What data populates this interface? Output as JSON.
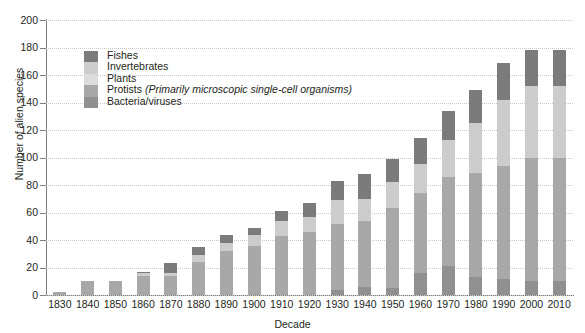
{
  "chart_data": {
    "type": "bar",
    "subtype": "stacked-bar",
    "title": "",
    "xlabel": "Decade",
    "ylabel": "Number of alien species",
    "ylim": [
      0,
      200
    ],
    "ytick_step": 20,
    "yticks": [
      0,
      20,
      40,
      60,
      80,
      100,
      120,
      140,
      160,
      180,
      200
    ],
    "grid": true,
    "grid_style": "dotted-horizontal",
    "legend_position": "inside-top-left",
    "categories": [
      "1830",
      "1840",
      "1850",
      "1860",
      "1870",
      "1880",
      "1890",
      "1900",
      "1910",
      "1920",
      "1930",
      "1940",
      "1950",
      "1960",
      "1970",
      "1980",
      "1990",
      "2000",
      "2010"
    ],
    "stack_order_bottom_to_top": [
      "Bacteria/viruses",
      "Protists",
      "Plants",
      "Invertebrates",
      "Fishes"
    ],
    "series": [
      {
        "name": "Fishes",
        "color": "#7b7b7b",
        "values": [
          0,
          0,
          0,
          1,
          7,
          6,
          6,
          5,
          7,
          10,
          14,
          18,
          17,
          19,
          21,
          24,
          27,
          26,
          26
        ]
      },
      {
        "name": "Invertebrates",
        "color": "#cccccc",
        "values": [
          0,
          0,
          0,
          2,
          2,
          5,
          6,
          8,
          11,
          11,
          17,
          16,
          19,
          21,
          27,
          36,
          48,
          52,
          52
        ]
      },
      {
        "name": "Plants",
        "color": "#dcdcdc",
        "values": [
          0,
          0,
          0,
          0,
          0,
          0,
          0,
          0,
          0,
          0,
          0,
          0,
          0,
          0,
          0,
          0,
          0,
          0,
          0
        ]
      },
      {
        "name": "Protists",
        "color": "#a8a8a8",
        "values": [
          2,
          10,
          10,
          14,
          14,
          24,
          32,
          36,
          43,
          46,
          48,
          48,
          58,
          58,
          65,
          76,
          82,
          90,
          90
        ]
      },
      {
        "name": "Bacteria/viruses",
        "color": "#909090",
        "values": [
          0,
          0,
          0,
          0,
          0,
          0,
          0,
          0,
          0,
          0,
          4,
          6,
          5,
          16,
          21,
          13,
          12,
          10,
          10
        ]
      }
    ],
    "totals": [
      2,
      10,
      10,
      17,
      23,
      35,
      44,
      49,
      61,
      67,
      83,
      88,
      99,
      114,
      134,
      149,
      169,
      178,
      178
    ]
  },
  "legend": {
    "items": [
      {
        "label": "Fishes",
        "note": "",
        "color": "#7b7b7b"
      },
      {
        "label": "Invertebrates",
        "note": "",
        "color": "#cccccc"
      },
      {
        "label": "Plants",
        "note": "",
        "color": "#dcdcdc"
      },
      {
        "label": "Protists",
        "note": "(Primarily microscopic single-cell organisms)",
        "color": "#a8a8a8"
      },
      {
        "label": "Bacteria/viruses",
        "note": "",
        "color": "#909090"
      }
    ]
  },
  "colors": {
    "axis": "#808080",
    "grid": "#c8c8c8",
    "text": "#231f20",
    "background": "#ffffff"
  }
}
